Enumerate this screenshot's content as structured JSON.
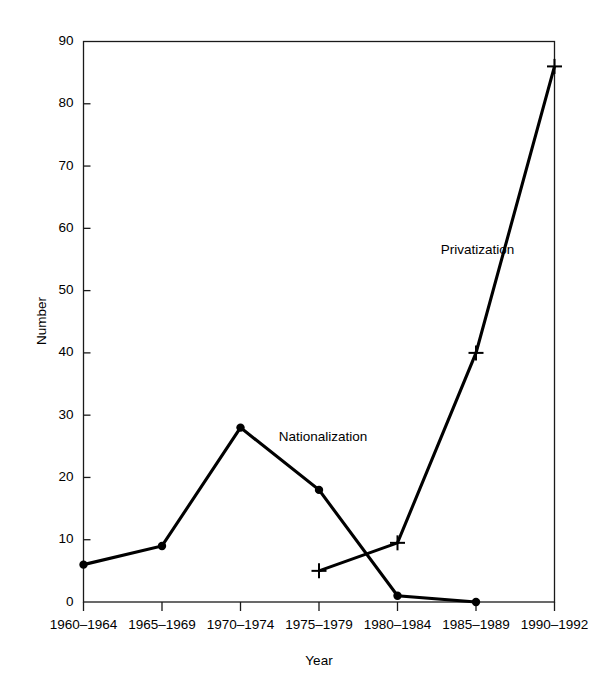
{
  "chart_data": {
    "type": "line",
    "title": "",
    "xlabel": "Year",
    "ylabel": "Number",
    "categories": [
      "1960–1964",
      "1965–1969",
      "1970–1974",
      "1975–1979",
      "1980–1984",
      "1985–1989",
      "1990–1992"
    ],
    "ylim": [
      0,
      90
    ],
    "yticks": [
      0,
      10,
      20,
      30,
      40,
      50,
      60,
      70,
      80,
      90
    ],
    "ytick_labels": [
      "0",
      "10",
      "20",
      "30",
      "40",
      "50",
      "60",
      "70",
      "80",
      "90"
    ],
    "grid": false,
    "legend_position": "inline-annotations",
    "series": [
      {
        "name": "Nationalization",
        "marker": "filled-circle",
        "x": [
          "1960–1964",
          "1965–1969",
          "1970–1974",
          "1975–1979",
          "1980–1984",
          "1985–1989"
        ],
        "values": [
          6,
          9,
          28,
          18,
          1,
          0
        ]
      },
      {
        "name": "Privatization",
        "marker": "plus",
        "x": [
          "1975–1979",
          "1980–1984",
          "1985–1989",
          "1990–1992"
        ],
        "values": [
          5,
          9.5,
          40,
          86
        ]
      }
    ],
    "annotations": [
      {
        "text": "Nationalization",
        "x_value": 3.05,
        "y_value": 26.5
      },
      {
        "text": "Privatization",
        "x_value": 5.02,
        "y_value": 56.5
      }
    ]
  },
  "axes": {
    "y_axis_title": "Number",
    "x_axis_title": "Year"
  },
  "colors": {
    "line": "#000000",
    "axis": "#1a1a1a",
    "background": "#ffffff"
  }
}
